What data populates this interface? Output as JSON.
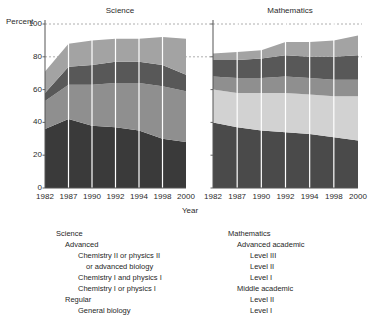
{
  "axis": {
    "y_label": "Percent",
    "x_label": "Year",
    "y_ticks": [
      "100",
      "80",
      "60",
      "40",
      "20",
      "0"
    ]
  },
  "panels": {
    "science": {
      "title": "Science",
      "x_ticks": [
        "1982",
        "1987",
        "1990",
        "1992",
        "1994",
        "1998",
        "2000"
      ]
    },
    "mathematics": {
      "title": "Mathematics",
      "x_ticks": [
        "1982",
        "1987",
        "1990",
        "1992",
        "1994",
        "1998",
        "2000"
      ]
    }
  },
  "legend": {
    "science": {
      "heading": "Science",
      "group_advanced": "Advanced",
      "item_chem2": "Chemistry II or physics II",
      "item_chem2_cont": "or advanced biology",
      "item_chem1_and": "Chemistry I and physics I",
      "item_chem1_or": "Chemistry I or physics I",
      "group_regular": "Regular",
      "item_genbio": "General biology"
    },
    "mathematics": {
      "heading": "Mathematics",
      "group_advanced": "Advanced academic",
      "item_adv_3": "Level III",
      "item_adv_2": "Level II",
      "item_adv_1": "Level I",
      "group_middle": "Middle academic",
      "item_mid_2": "Level II",
      "item_mid_1": "Level I"
    }
  },
  "colors": {
    "band_darkest": "#3a3a3a",
    "band_dark": "#4a4a4a",
    "band_mid_dark": "#585858",
    "band_mid": "#8f8f8f",
    "band_light_mid": "#a3a3a3",
    "band_light": "#d2d2d2",
    "axis": "#555555",
    "gridline": "#9a9a9a",
    "separator": "#ffffff"
  },
  "chart_data": [
    {
      "type": "area",
      "title": "Science",
      "xlabel": "Year",
      "ylabel": "Percent",
      "ylim": [
        0,
        100
      ],
      "grid": true,
      "gridlines": [
        80,
        100
      ],
      "legend_position": "bottom-left",
      "x": [
        1982,
        1987,
        1990,
        1992,
        1994,
        1998,
        2000
      ],
      "stacked": true,
      "series": [
        {
          "name": "General biology",
          "values": [
            36,
            42,
            38,
            37,
            35,
            30,
            28
          ]
        },
        {
          "name": "Chemistry I or physics I",
          "values": [
            17,
            21,
            25,
            27,
            29,
            32,
            31
          ]
        },
        {
          "name": "Chemistry I and physics I",
          "values": [
            5,
            11,
            12,
            13,
            13,
            13,
            10
          ]
        },
        {
          "name": "Chemistry II or physics II or advanced biology",
          "values": [
            13,
            14,
            15,
            14,
            14,
            17,
            22
          ]
        }
      ],
      "totals": [
        71,
        88,
        90,
        91,
        91,
        92,
        91
      ]
    },
    {
      "type": "area",
      "title": "Mathematics",
      "xlabel": "Year",
      "ylabel": "Percent",
      "ylim": [
        0,
        100
      ],
      "grid": true,
      "gridlines": [
        80,
        100
      ],
      "legend_position": "bottom-right",
      "x": [
        1982,
        1987,
        1990,
        1992,
        1994,
        1998,
        2000
      ],
      "stacked": true,
      "series": [
        {
          "name": "Middle academic Level I",
          "values": [
            40,
            37,
            35,
            34,
            33,
            31,
            29
          ]
        },
        {
          "name": "Middle academic Level II",
          "values": [
            20,
            21,
            23,
            24,
            24,
            25,
            27
          ]
        },
        {
          "name": "Advanced academic Level I",
          "values": [
            8,
            9,
            9,
            10,
            10,
            10,
            10
          ]
        },
        {
          "name": "Advanced academic Level II",
          "values": [
            10,
            11,
            12,
            13,
            13,
            14,
            15
          ]
        },
        {
          "name": "Advanced academic Level III",
          "values": [
            4,
            5,
            5,
            8,
            9,
            10,
            12
          ]
        }
      ],
      "totals": [
        82,
        83,
        84,
        89,
        89,
        90,
        93
      ]
    }
  ]
}
